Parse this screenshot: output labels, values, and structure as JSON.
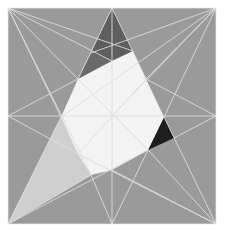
{
  "figure": {
    "square": {
      "x": 8,
      "y": 8,
      "width": 208,
      "height": 216
    },
    "colors": {
      "background": "#ffffff",
      "square_fill": "#9a9a9a",
      "center_fill": "#f3f3f3",
      "dark_top": "#5e5e5e",
      "dark_top_mid": "#6e6e6e",
      "black_right": "#1e1e1e",
      "light_left": "#c4c4c4",
      "light_left_inner": "#d6d6d6",
      "line": "#dcdcdc"
    }
  }
}
